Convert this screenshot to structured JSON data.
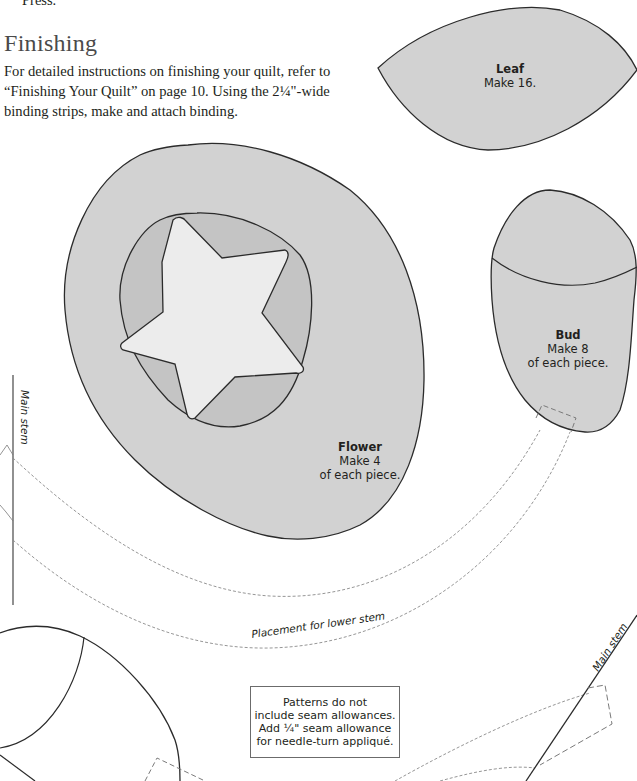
{
  "page": {
    "previous_paragraph_tail": "Press.",
    "section": {
      "title": "Finishing",
      "body": "For detailed instructions on finishing your quilt, refer to “Finishing Your Quilt” on page 10. Using the 2¼\"-wide binding strips, make and attach binding."
    }
  },
  "patterns": {
    "leaf": {
      "name": "Leaf",
      "instruction": "Make 16."
    },
    "flower": {
      "name": "Flower",
      "instruction_line1": "Make 4",
      "instruction_line2": "of each piece."
    },
    "bud": {
      "name": "Bud",
      "instruction_line1": "Make 8",
      "instruction_line2": "of each piece."
    },
    "main_stem_left_label": "Main stem",
    "main_stem_right_label": "Main stem",
    "lower_stem_label": "Placement for lower stem"
  },
  "note": {
    "line1": "Patterns do not",
    "line2": "include seam allowances.",
    "line3": "Add ¼\" seam allowance",
    "line4": "for needle-turn appliqué."
  },
  "colors": {
    "piece_fill": "#d2d2d2",
    "inner_fill": "#c4c4c4",
    "star_fill": "#ececec",
    "outline": "#2b2b2b",
    "dashed": "#8a8a8a"
  }
}
